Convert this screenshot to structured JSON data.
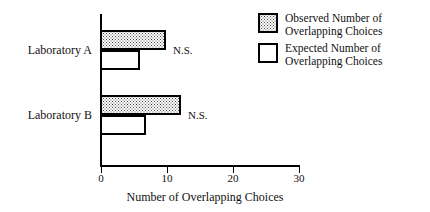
{
  "chart_data": {
    "type": "bar",
    "orientation": "horizontal",
    "title": "",
    "xlabel": "Number of Overlapping Choices",
    "ylabel": "",
    "xlim": [
      0,
      30
    ],
    "xticks": [
      0,
      10,
      20,
      30
    ],
    "xtick_labels": [
      "0",
      "10",
      "20",
      "30"
    ],
    "grid": false,
    "legend_position": "top-right",
    "categories": [
      "Laboratory A",
      "Laboratory B"
    ],
    "series": [
      {
        "name": "Observed Number of Overlapping Choices",
        "values": [
          10,
          12.3
        ]
      },
      {
        "name": "Expected Number of Overlapping Choices",
        "values": [
          6,
          7
        ]
      }
    ],
    "annotations": [
      {
        "category": "Laboratory A",
        "text": "N.S."
      },
      {
        "category": "Laboratory B",
        "text": "N.S."
      }
    ]
  },
  "legend": {
    "items": [
      {
        "swatch": "stippled-square",
        "line1": "Observed Number of",
        "line2": "Overlapping Choices"
      },
      {
        "swatch": "open-square",
        "line1": "Expected Number of",
        "line2": "Overlapping Choices"
      }
    ]
  }
}
